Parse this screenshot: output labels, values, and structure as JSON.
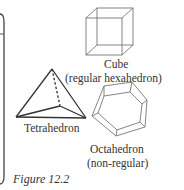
{
  "figure": {
    "caption": "Figure 12.2",
    "shapes": [
      {
        "id": "cube",
        "label_line1": "Cube",
        "label_line2": "(regular hexahedron)"
      },
      {
        "id": "tetrahedron",
        "label_line1": "Tetrahedron"
      },
      {
        "id": "octahedron",
        "label_line1": "Octahedron",
        "label_line2": "(non-regular)"
      }
    ]
  },
  "colors": {
    "line": "#555555",
    "text": "#333333",
    "background": "#ffffff"
  }
}
